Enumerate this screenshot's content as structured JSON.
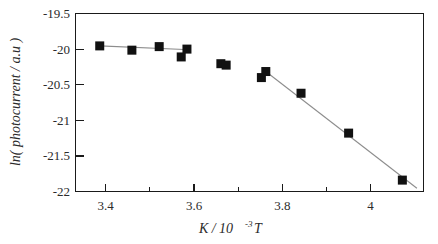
{
  "chart_data": {
    "type": "scatter",
    "title": "",
    "subtitle": "",
    "xlabel": "K / 10-3 T",
    "xlabel_base": "K / 10",
    "xlabel_exponent": "-3",
    "xlabel_unit": "T",
    "ylabel": "ln( photocurrent / a.u )",
    "xlim": [
      3.33,
      4.12
    ],
    "ylim": [
      -22.0,
      -19.5
    ],
    "grid": false,
    "legend": "none",
    "x_ticks": [
      3.4,
      3.6,
      3.8,
      4.0
    ],
    "x_tick_labels": [
      "3.4",
      "3.6",
      "3.8",
      "4"
    ],
    "x_minor_ticks": [
      3.5,
      3.7,
      3.9
    ],
    "y_ticks": [
      -19.5,
      -20.0,
      -20.5,
      -21.0,
      -21.5,
      -22.0
    ],
    "y_tick_labels": [
      "-19.5",
      "-20",
      "-20.5",
      "-21",
      "-21.5",
      "-22"
    ],
    "marker_style": "filled-square",
    "marker_color": "#111111",
    "fit_line_color": "#8d8d8d",
    "series": [
      {
        "name": "ln(photocurrent)",
        "points": [
          {
            "x": 3.385,
            "y": -19.955
          },
          {
            "x": 3.458,
            "y": -20.015
          },
          {
            "x": 3.52,
            "y": -19.965
          },
          {
            "x": 3.57,
            "y": -20.11
          },
          {
            "x": 3.583,
            "y": -20.0
          },
          {
            "x": 3.66,
            "y": -20.205
          },
          {
            "x": 3.672,
            "y": -20.225
          },
          {
            "x": 3.752,
            "y": -20.4
          },
          {
            "x": 3.762,
            "y": -20.315
          },
          {
            "x": 3.842,
            "y": -20.62
          },
          {
            "x": 3.95,
            "y": -21.18
          },
          {
            "x": 4.072,
            "y": -21.84
          }
        ]
      }
    ],
    "fit_lines": [
      {
        "name": "low-temperature-regime-fit",
        "x1": 3.385,
        "y1": -19.955,
        "x2": 3.59,
        "y2": -20.01
      },
      {
        "name": "high-temperature-regime-fit",
        "x1": 3.762,
        "y1": -20.315,
        "x2": 4.105,
        "y2": -21.955
      }
    ]
  }
}
